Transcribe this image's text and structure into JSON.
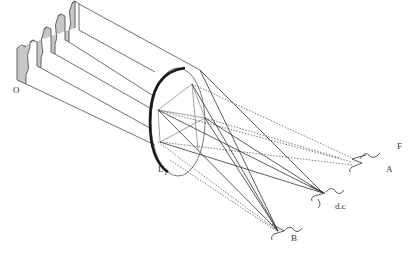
{
  "diagram": {
    "labels": {
      "source": "O",
      "lens": "L",
      "lens_subscript": "1",
      "focal_plane": "F",
      "order_a": "A",
      "direct_component": "d.c",
      "order_b": "B"
    },
    "colors": {
      "line": "#333333",
      "lens_rim": "#1a1a1a",
      "wave_fill": "#bdbdbd",
      "background": "#ffffff"
    }
  }
}
